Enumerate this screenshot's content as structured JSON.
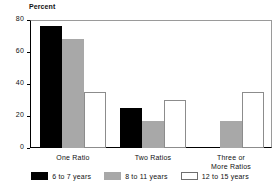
{
  "chart_data": {
    "type": "bar",
    "title": "",
    "xlabel": "",
    "ylabel": "Percent",
    "ylim": [
      0,
      80
    ],
    "yticks": [
      0,
      20,
      40,
      60,
      80
    ],
    "ytick_labels": [
      "0",
      "20",
      "40",
      "60",
      "80"
    ],
    "grid": false,
    "legend_position": "bottom",
    "categories": [
      "One Ratio",
      "Two Ratios",
      "Three or More Ratios"
    ],
    "category_label_lines": [
      [
        "One Ratio"
      ],
      [
        "Two Ratios"
      ],
      [
        "Three or",
        "More Ratios"
      ]
    ],
    "series": [
      {
        "name": "6 to 7 years",
        "color": "#000000",
        "values": [
          76,
          25,
          0
        ]
      },
      {
        "name": "8 to 11 years",
        "color": "#a8a8a8",
        "values": [
          68,
          17,
          17
        ]
      },
      {
        "name": "12 to 15 years",
        "color": "#ffffff",
        "values": [
          35,
          30,
          35
        ]
      }
    ]
  },
  "legend": {
    "items": [
      {
        "label": "6 to 7 years",
        "swatch": "black"
      },
      {
        "label": "8 to 11 years",
        "swatch": "gray"
      },
      {
        "label": "12 to 15 years",
        "swatch": "white"
      }
    ]
  },
  "colors": {
    "series_black": "#000000",
    "series_gray": "#a8a8a8",
    "series_white": "#ffffff",
    "axis": "#000000",
    "frame": "#9a9a9a",
    "background": "#ffffff"
  }
}
